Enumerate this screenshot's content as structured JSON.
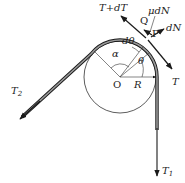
{
  "diagram": {
    "labels": {
      "tension_plus": "T+dT",
      "friction": "μdN",
      "normal": "dN",
      "point_q": "Q",
      "point_p": "P",
      "tension_t": "T",
      "d_theta": "dθ",
      "alpha": "α",
      "theta": "θ",
      "center": "O",
      "radius": "R",
      "t2_main": "T",
      "t2_sub": "2",
      "t1_main": "T",
      "t1_sub": "1"
    },
    "colors": {
      "line": "#1a1a1a",
      "belt_fill": "#8a8a8a",
      "circle": "#333333"
    },
    "geometry": {
      "center": [
        120,
        77
      ],
      "radius": 37
    }
  }
}
